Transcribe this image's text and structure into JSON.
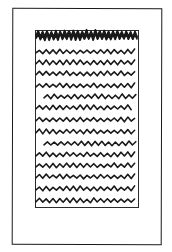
{
  "sketch": {
    "description": "Hand-drawn sketch of a page layout with a text block",
    "stroke_color": "#1a1a1a",
    "background": "#ffffff",
    "page_frame": {
      "x": 12,
      "y": 8,
      "w": 150,
      "h": 237
    },
    "text_block": {
      "x": 35,
      "y": 30,
      "w": 104,
      "h": 178
    },
    "heading": {
      "y": 36,
      "x_start": 36,
      "x_end": 138,
      "thickness": 9
    },
    "body_lines": [
      {
        "y": 52,
        "x_start": 36,
        "x_end": 137,
        "indent": false
      },
      {
        "y": 63,
        "x_start": 36,
        "x_end": 136,
        "indent": false
      },
      {
        "y": 74,
        "x_start": 36,
        "x_end": 137,
        "indent": false
      },
      {
        "y": 86,
        "x_start": 36,
        "x_end": 136,
        "indent": false
      },
      {
        "y": 97,
        "x_start": 44,
        "x_end": 137,
        "indent": true
      },
      {
        "y": 108,
        "x_start": 36,
        "x_end": 134,
        "indent": false
      },
      {
        "y": 120,
        "x_start": 36,
        "x_end": 136,
        "indent": false
      },
      {
        "y": 132,
        "x_start": 36,
        "x_end": 135,
        "indent": false
      },
      {
        "y": 144,
        "x_start": 44,
        "x_end": 136,
        "indent": true
      },
      {
        "y": 155,
        "x_start": 36,
        "x_end": 137,
        "indent": false
      },
      {
        "y": 166,
        "x_start": 36,
        "x_end": 135,
        "indent": false
      },
      {
        "y": 177,
        "x_start": 36,
        "x_end": 137,
        "indent": false
      },
      {
        "y": 189,
        "x_start": 36,
        "x_end": 136,
        "indent": false
      },
      {
        "y": 201,
        "x_start": 36,
        "x_end": 137,
        "indent": false
      }
    ]
  }
}
